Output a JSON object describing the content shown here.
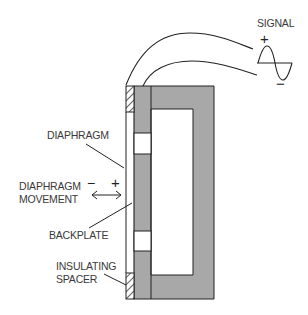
{
  "diagram": {
    "colors": {
      "metal_fill": "#a8a8a8",
      "outline": "#222222",
      "label_text": "#3a3a3a",
      "background": "#ffffff"
    },
    "labels": {
      "signal": "SIGNAL",
      "signal_plus": "+",
      "signal_minus": "−",
      "diaphragm": "DIAPHRAGM",
      "movement_line1": "DIAPHRAGM",
      "movement_line2": "MOVEMENT",
      "movement_minus": "−",
      "movement_plus": "+",
      "backplate": "BACKPLATE",
      "spacer_line1": "INSULATING",
      "spacer_line2": "SPACER"
    },
    "components": [
      {
        "name": "diaphragm",
        "description": "thin membrane"
      },
      {
        "name": "backplate",
        "description": "perforated conductive plate"
      },
      {
        "name": "insulating-spacer",
        "description": "hatched spacers top and bottom"
      },
      {
        "name": "housing",
        "description": "C-shaped frame"
      },
      {
        "name": "signal-wires",
        "count": 2
      },
      {
        "name": "signal-waveform",
        "type": "sine"
      }
    ]
  }
}
